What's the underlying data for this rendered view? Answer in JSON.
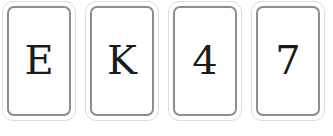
{
  "scene": {
    "description": "row-of-playing-cards",
    "background_color": "#ffffff",
    "card_face_color": "#ffffff",
    "card_outer_border_color": "#dcdcdc",
    "card_inner_border_color": "#8d8d8d",
    "rank_text_color": "#1b1b1b",
    "card_count": 4
  },
  "cards": [
    {
      "rank": "E",
      "name": "card-e"
    },
    {
      "rank": "K",
      "name": "card-k"
    },
    {
      "rank": "4",
      "name": "card-4"
    },
    {
      "rank": "7",
      "name": "card-7"
    }
  ]
}
